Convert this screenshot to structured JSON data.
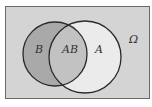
{
  "diagram": {
    "type": "venn",
    "universe": {
      "label": "Ω",
      "fill": "#d4d4d4",
      "border": "#555555"
    },
    "sets": [
      {
        "id": "B",
        "label": "B",
        "fill": "#a9a9a9"
      },
      {
        "id": "A",
        "label": "A",
        "fill": "#ebebeb"
      }
    ],
    "intersection": {
      "label": "AB",
      "fill": "#c2c2c2"
    },
    "stroke": "#2a2a2a"
  }
}
